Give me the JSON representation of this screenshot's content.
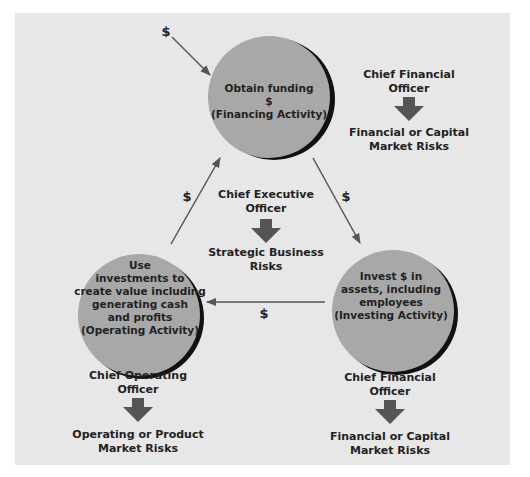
{
  "colors": {
    "panel": "#e7e7e7",
    "circle_fill": "#a8a8a8",
    "circle_shadow": "#111111",
    "arrow": "#555555",
    "text": "#222222"
  },
  "nodes": {
    "financing": {
      "lines": [
        "Obtain funding",
        "$",
        "(Financing Activity)"
      ]
    },
    "operating": {
      "lines": [
        "Use",
        "investments to",
        "create value including",
        "generating cash",
        "and profits",
        "(Operating Activity)"
      ]
    },
    "investing": {
      "lines": [
        "Invest $ in",
        "assets, including",
        "employees",
        "(Investing Activity)"
      ]
    }
  },
  "flows": {
    "external_in": "$",
    "financing_to_investing": "$",
    "investing_to_operating": "$",
    "operating_to_financing": "$"
  },
  "roles": {
    "cfo_top": {
      "officer": [
        "Chief Financial",
        "Officer"
      ],
      "risk": [
        "Financial or Capital",
        "Market Risks"
      ]
    },
    "ceo_center": {
      "officer": [
        "Chief Executive",
        "Officer"
      ],
      "risk": [
        "Strategic Business",
        "Risks"
      ]
    },
    "coo_bottom": {
      "officer": [
        "Chief Operating",
        "Officer"
      ],
      "risk": [
        "Operating or Product",
        "Market Risks"
      ]
    },
    "cfo_bottom": {
      "officer": [
        "Chief Financial",
        "Officer"
      ],
      "risk": [
        "Financial or Capital",
        "Market Risks"
      ]
    }
  }
}
